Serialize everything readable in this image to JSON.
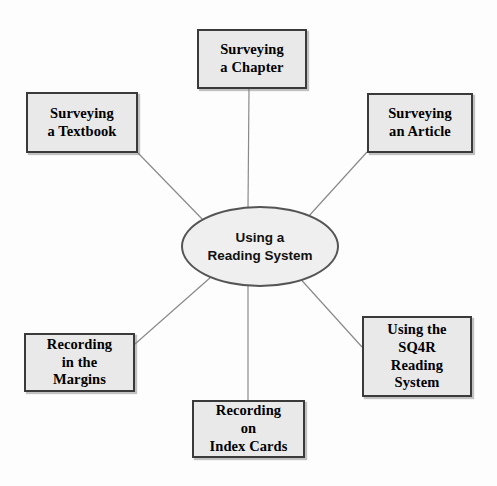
{
  "diagram": {
    "center": {
      "id": "center-node",
      "label": "Using a\nReading System",
      "shape": "ellipse",
      "fill": "#efefef",
      "stroke": "#555555"
    },
    "style": {
      "box_fill": "#e9e9e9",
      "box_border": "#3a3a3a",
      "connector_color": "#8a8a8a",
      "background": "#fdfdfd",
      "text_color": "#000000"
    },
    "nodes": [
      {
        "id": "box-surveying-chapter",
        "name": "surveying-a-chapter",
        "label": "Surveying\na Chapter",
        "position": "top"
      },
      {
        "id": "box-surveying-textbook",
        "name": "surveying-a-textbook",
        "label": "Surveying\na Textbook",
        "position": "upper-left"
      },
      {
        "id": "box-surveying-article",
        "name": "surveying-an-article",
        "label": "Surveying\nan Article",
        "position": "upper-right"
      },
      {
        "id": "box-sq4r",
        "name": "using-the-sq4r-reading-system",
        "label": "Using the\nSQ4R\nReading\nSystem",
        "position": "lower-right"
      },
      {
        "id": "box-index-cards",
        "name": "recording-on-index-cards",
        "label": "Recording\non\nIndex Cards",
        "position": "bottom"
      },
      {
        "id": "box-margins",
        "name": "recording-in-the-margins",
        "label": "Recording\nin the\nMargins",
        "position": "lower-left"
      }
    ],
    "connectors": [
      {
        "name": "connector-center-to-chapter",
        "from": "center-node",
        "to": "box-surveying-chapter",
        "x1": 248,
        "y1": 208,
        "x2": 249,
        "y2": 89
      },
      {
        "name": "connector-center-to-textbook",
        "from": "center-node",
        "to": "box-surveying-textbook",
        "x1": 206,
        "y1": 223,
        "x2": 138,
        "y2": 153
      },
      {
        "name": "connector-center-to-article",
        "from": "center-node",
        "to": "box-surveying-article",
        "x1": 298,
        "y1": 228,
        "x2": 367,
        "y2": 152
      },
      {
        "name": "connector-center-to-sq4r",
        "from": "center-node",
        "to": "box-sq4r",
        "x1": 296,
        "y1": 274,
        "x2": 362,
        "y2": 347
      },
      {
        "name": "connector-center-to-index",
        "from": "center-node",
        "to": "box-index-cards",
        "x1": 248,
        "y1": 286,
        "x2": 248,
        "y2": 400
      },
      {
        "name": "connector-center-to-margins",
        "from": "center-node",
        "to": "box-margins",
        "x1": 211,
        "y1": 277,
        "x2": 135,
        "y2": 344
      }
    ]
  }
}
